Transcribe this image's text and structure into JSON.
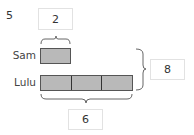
{
  "problem": {
    "number": "5"
  },
  "bar_model": {
    "rows": [
      {
        "name": "Sam",
        "units": 1
      },
      {
        "name": "Lulu",
        "units": 3
      }
    ],
    "unit_value_label": "2",
    "lulu_total_label": "6",
    "combined_total_label": "8",
    "colors": {
      "bar_fill": "#b9b9b9",
      "bar_border": "#555555",
      "brace": "#555555",
      "box_border": "#e2e2e2"
    }
  }
}
